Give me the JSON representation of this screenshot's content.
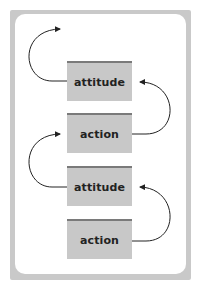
{
  "diagram": {
    "boxes": [
      {
        "label": "attitude"
      },
      {
        "label": "action"
      },
      {
        "label": "attitude"
      },
      {
        "label": "action"
      }
    ],
    "colors": {
      "frame": "#c9c9c9",
      "box_fill": "#c8c8c8",
      "box_top_bar": "#7a7a7a",
      "arrow": "#222222"
    },
    "arrows": [
      {
        "from": "attitude (1)",
        "to": "above",
        "side": "left"
      },
      {
        "from": "action (2)",
        "to": "attitude (1)",
        "side": "right"
      },
      {
        "from": "attitude (3)",
        "to": "action (2)",
        "side": "left"
      },
      {
        "from": "action (4)",
        "to": "attitude (3)",
        "side": "right"
      }
    ]
  }
}
